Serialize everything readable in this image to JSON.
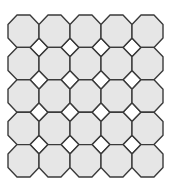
{
  "diagram": {
    "type": "truncated-square-tiling",
    "rows": 5,
    "cols": 5,
    "origin": [
      8,
      15
    ],
    "cell_width": 31,
    "cell_height": 32.4,
    "corner_ratio": 0.29,
    "octagon_fill": "#e6e6e6",
    "square_fill": "#ffffff",
    "stroke": "#3a3a3a",
    "stroke_width": 1.4,
    "background": "#ffffff"
  }
}
